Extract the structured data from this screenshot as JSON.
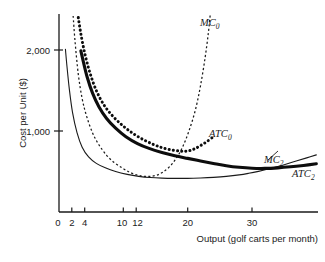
{
  "chart_data": {
    "type": "line",
    "title": "",
    "xlabel": "Output (golf carts per month)",
    "ylabel": "Cost per Unit ($)",
    "xlim": [
      0,
      41
    ],
    "ylim": [
      0,
      2450
    ],
    "grid": false,
    "legend_position": "inline-curve-labels",
    "xticks": [
      0,
      2,
      4,
      10,
      12,
      20,
      30
    ],
    "xtick_labels": [
      "0",
      "2",
      "4",
      "10",
      "12",
      "20",
      "30"
    ],
    "yticks": [
      1000,
      2000
    ],
    "ytick_labels": [
      "1,000",
      "2,000"
    ],
    "series": [
      {
        "name": "MC0",
        "label": "MC",
        "subscript": "0",
        "style": "thin-dashed",
        "color": "#1a1a1a",
        "x": [
          2.2,
          2.5,
          3.0,
          3.6,
          4.3,
          5.2,
          6.2,
          7.4,
          8.6,
          9.9,
          11.0,
          12.2,
          13.2,
          14.2,
          15.2,
          16.2,
          17.2,
          18.2,
          19.2,
          20.2,
          21.2,
          22.0,
          22.7,
          23.2,
          23.5
        ],
        "y": [
          2420,
          2100,
          1700,
          1400,
          1180,
          980,
          830,
          700,
          610,
          540,
          490,
          455,
          440,
          440,
          455,
          495,
          560,
          660,
          800,
          1000,
          1260,
          1560,
          1900,
          2200,
          2430
        ]
      },
      {
        "name": "ATC0",
        "label": "ATC",
        "subscript": "0",
        "style": "thick-dotted",
        "color": "#0d0d0d",
        "x": [
          3.0,
          3.4,
          4.0,
          4.8,
          5.8,
          7.0,
          8.4,
          10.0,
          11.6,
          13.2,
          14.8,
          16.2,
          17.6,
          18.8,
          19.6,
          20.4,
          21.2,
          22.0,
          23.0,
          24.0
        ],
        "y": [
          2400,
          2200,
          1960,
          1720,
          1500,
          1320,
          1180,
          1060,
          965,
          890,
          830,
          790,
          765,
          752,
          750,
          760,
          785,
          820,
          870,
          930
        ]
      },
      {
        "name": "MC2",
        "label": "MC",
        "subscript": "2",
        "style": "thin-solid",
        "color": "#1a1a1a",
        "x": [
          1.0,
          1.2,
          1.6,
          2.1,
          2.8,
          3.6,
          4.6,
          5.8,
          7.2,
          8.8,
          10.6,
          12.4,
          14.2,
          16.0,
          18.0,
          20.0,
          22.0,
          24.0,
          26.0,
          28.0,
          29.5,
          31.0,
          32.5,
          34.0,
          35.5,
          37.0,
          38.5,
          40.0
        ],
        "y": [
          2010,
          1830,
          1520,
          1230,
          980,
          800,
          680,
          600,
          545,
          500,
          465,
          440,
          425,
          418,
          415,
          415,
          420,
          428,
          440,
          458,
          478,
          502,
          530,
          562,
          596,
          632,
          668,
          705
        ]
      },
      {
        "name": "ATC2",
        "label": "ATC",
        "subscript": "2",
        "style": "thick-solid",
        "color": "#0d0d0d",
        "x": [
          3.4,
          3.8,
          4.4,
          5.2,
          6.2,
          7.4,
          8.8,
          10.4,
          12.2,
          14.0,
          16.0,
          18.0,
          20.0,
          22.0,
          24.0,
          26.0,
          28.0,
          30.0,
          32.0,
          34.0,
          36.0,
          38.0,
          40.0
        ],
        "y": [
          1990,
          1850,
          1660,
          1470,
          1300,
          1155,
          1035,
          930,
          845,
          785,
          735,
          695,
          662,
          630,
          600,
          572,
          552,
          540,
          538,
          545,
          558,
          575,
          595
        ]
      }
    ],
    "annotations": [
      {
        "name": "MC0",
        "text": "MC",
        "sub": "0"
      },
      {
        "name": "ATC0",
        "text": "ATC",
        "sub": "0"
      },
      {
        "name": "MC2",
        "text": "MC",
        "sub": "2"
      },
      {
        "name": "ATC2",
        "text": "ATC",
        "sub": "2"
      }
    ]
  },
  "axes": {
    "y_title": "Cost per Unit ($)",
    "x_title": "Output (golf carts per month)",
    "y_tick_2000": "2,000",
    "y_tick_1000": "1,000",
    "x_tick_0": "0",
    "x_tick_2": "2",
    "x_tick_4": "4",
    "x_tick_10": "10",
    "x_tick_12": "12",
    "x_tick_20": "20",
    "x_tick_30": "30"
  },
  "labels": {
    "mc0_text": "MC",
    "mc0_sub": "0",
    "atc0_text": "ATC",
    "atc0_sub": "0",
    "mc2_text": "MC",
    "mc2_sub": "2",
    "atc2_text": "ATC",
    "atc2_sub": "2"
  },
  "colors": {
    "ink": "#1a1a1a",
    "heavy_ink": "#0d0d0d",
    "background": "#ffffff"
  }
}
